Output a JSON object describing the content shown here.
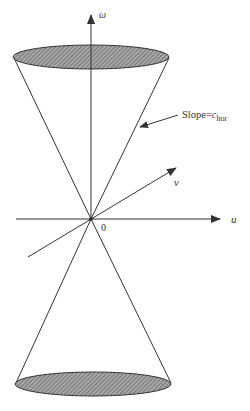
{
  "figure": {
    "type": "light-cone diagram",
    "axes": {
      "vertical": {
        "label": "ω"
      },
      "horizontal": {
        "label": "u"
      },
      "oblique": {
        "label": "v"
      }
    },
    "origin_label": "0",
    "annotation": {
      "text_prefix": "Slope=",
      "symbol": "c",
      "subscript": "hor"
    },
    "cones": [
      {
        "name": "upper-cone",
        "cap": "hatched ellipse"
      },
      {
        "name": "lower-cone",
        "cap": "hatched ellipse"
      }
    ]
  },
  "colors": {
    "line": "#333333",
    "hatch_fill": "#9a9a9a",
    "hatch_line": "#555555",
    "background": "#ffffff"
  }
}
